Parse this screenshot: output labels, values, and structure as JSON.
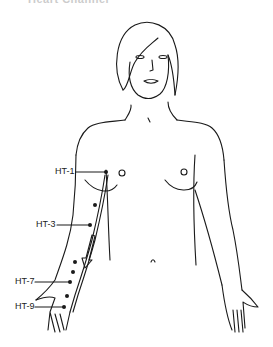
{
  "diagram": {
    "title_partial": "Heart Channel",
    "meridian_color": "#1a1a1a",
    "labels": [
      {
        "id": "ht1",
        "text": "HT-1",
        "x": 55,
        "y": 171
      },
      {
        "id": "ht3",
        "text": "HT-3",
        "x": 36,
        "y": 224
      },
      {
        "id": "ht7",
        "text": "HT-7",
        "x": 15,
        "y": 281
      },
      {
        "id": "ht9",
        "text": "HT-9",
        "x": 15,
        "y": 306
      }
    ],
    "arrow": "flow direction down the arm"
  }
}
